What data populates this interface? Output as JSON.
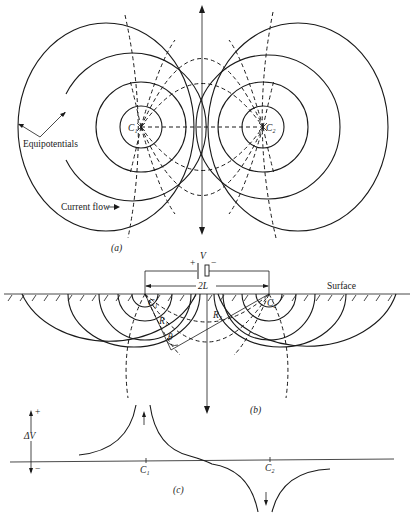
{
  "figure": {
    "panel_a": {
      "caption": "(a)",
      "electrode_1": "C₁",
      "electrode_2": "C₂",
      "label_equipotentials": "Equipotentials",
      "label_current_flow": "Current flow"
    },
    "panel_b": {
      "caption": "(b)",
      "battery_label": "V",
      "battery_plus": "+",
      "battery_minus": "−",
      "spacing_label": "2L",
      "surface_label": "Surface",
      "electrode_1": "C₁",
      "electrode_2": "C₂",
      "r1_label": "R₁",
      "r2_label": "R₂",
      "angle_label": "θ"
    },
    "panel_c": {
      "caption": "(c)",
      "axis_label": "ΔV",
      "axis_plus": "+",
      "axis_minus": "−",
      "tick_1": "C₁",
      "tick_2": "C₂"
    }
  }
}
